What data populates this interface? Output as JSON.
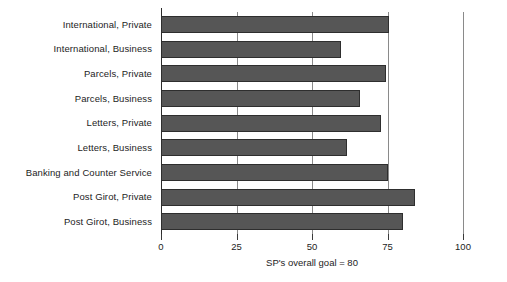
{
  "chart_data": {
    "type": "bar",
    "orientation": "horizontal",
    "title": "",
    "xlabel": "SP's overall goal = 80",
    "ylabel": "",
    "xlim": [
      0,
      100
    ],
    "xticks": [
      0,
      25,
      50,
      75,
      100
    ],
    "xtick_labels": [
      "0",
      "25",
      "50",
      "75",
      "100"
    ],
    "grid": true,
    "legend": "none",
    "bar_color": "#565656",
    "bar_edge_color": "#2e2e2e",
    "categories": [
      "International, Private",
      "International, Business",
      "Parcels, Private",
      "Parcels, Business",
      "Letters, Private",
      "Letters, Business",
      "Banking and Counter Service",
      "Post Girot, Private",
      "Post Girot, Business"
    ],
    "values": [
      75.5,
      59.5,
      74.5,
      66,
      73,
      61.5,
      75,
      84,
      80
    ]
  },
  "axis": {
    "caption": "SP's overall goal = 80"
  }
}
